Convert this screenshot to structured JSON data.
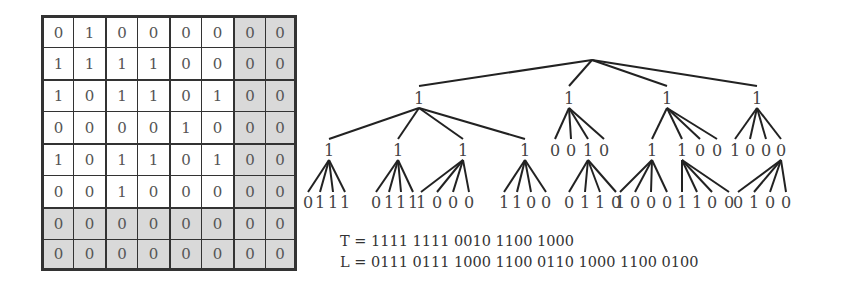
{
  "matrix": {
    "rows": [
      [
        0,
        1,
        0,
        0,
        0,
        0,
        0,
        0
      ],
      [
        1,
        1,
        1,
        1,
        0,
        0,
        0,
        0
      ],
      [
        1,
        0,
        1,
        1,
        0,
        1,
        0,
        0
      ],
      [
        0,
        0,
        0,
        0,
        1,
        0,
        0,
        0
      ],
      [
        1,
        0,
        1,
        1,
        0,
        1,
        0,
        0
      ],
      [
        0,
        0,
        1,
        0,
        0,
        0,
        0,
        0
      ],
      [
        0,
        0,
        0,
        0,
        0,
        0,
        0,
        0
      ],
      [
        0,
        0,
        0,
        0,
        0,
        0,
        0,
        0
      ]
    ],
    "shaded_cols": [
      6,
      7
    ],
    "shaded_rows": [
      6,
      7
    ],
    "block_size": 2,
    "colors": {
      "shade": "#d9d9d9",
      "line": "#333333",
      "text": "#555555"
    }
  },
  "tree": {
    "root": {
      "x": 592,
      "y": 60
    },
    "level1": [
      {
        "label": "1",
        "x": 419
      },
      {
        "label": "1",
        "x": 569
      },
      {
        "label": "1",
        "x": 667
      },
      {
        "label": "1",
        "x": 757
      }
    ],
    "level2": [
      {
        "label": "1",
        "x": 329,
        "parent": 0
      },
      {
        "label": "1",
        "x": 398,
        "parent": 0
      },
      {
        "label": "1",
        "x": 463,
        "parent": 0
      },
      {
        "label": "1",
        "x": 525,
        "parent": 0
      },
      {
        "label": "0",
        "x": 555,
        "parent": 1
      },
      {
        "label": "0",
        "x": 571,
        "parent": 1
      },
      {
        "label": "1",
        "x": 588,
        "parent": 1
      },
      {
        "label": "0",
        "x": 604,
        "parent": 1
      },
      {
        "label": "1",
        "x": 652,
        "parent": 2
      },
      {
        "label": "1",
        "x": 682,
        "parent": 2
      },
      {
        "label": "0",
        "x": 700,
        "parent": 2
      },
      {
        "label": "0",
        "x": 717,
        "parent": 2
      },
      {
        "label": "1",
        "x": 735,
        "parent": 3
      },
      {
        "label": "0",
        "x": 750,
        "parent": 3
      },
      {
        "label": "0",
        "x": 766,
        "parent": 3
      },
      {
        "label": "0",
        "x": 781,
        "parent": 3
      }
    ],
    "leaf_groups": [
      {
        "parent": 0,
        "labels": [
          "0",
          "1",
          "1",
          "1"
        ],
        "xs": [
          308,
          320,
          333,
          345
        ]
      },
      {
        "parent": 1,
        "labels": [
          "0",
          "1",
          "1",
          "1"
        ],
        "xs": [
          376,
          389,
          401,
          413
        ]
      },
      {
        "parent": 2,
        "labels": [
          "1",
          "0",
          "0",
          "0"
        ],
        "xs": [
          421,
          437,
          453,
          469
        ]
      },
      {
        "parent": 3,
        "labels": [
          "1",
          "1",
          "0",
          "0"
        ],
        "xs": [
          504,
          517,
          531,
          546
        ]
      },
      {
        "parent": 6,
        "labels": [
          "0",
          "1",
          "1",
          "0"
        ],
        "xs": [
          569,
          585,
          600,
          616
        ]
      },
      {
        "parent": 8,
        "labels": [
          "1",
          "0",
          "0",
          "0"
        ],
        "xs": [
          620,
          635,
          651,
          667
        ]
      },
      {
        "parent": 9,
        "labels": [
          "1",
          "1",
          "0",
          "0"
        ],
        "xs": [
          682,
          697,
          712,
          729
        ]
      },
      {
        "parent": 15,
        "labels": [
          "0",
          "1",
          "0",
          "0"
        ],
        "xs": [
          738,
          754,
          770,
          786
        ]
      }
    ],
    "y_level1": 100,
    "y_level2": 152,
    "y_leaves": 204
  },
  "equations": {
    "T": "T = 1111 1111 0010 1100 1000",
    "L": "L = 0111 0111 1000 1100 0110 1000 1100 0100"
  }
}
